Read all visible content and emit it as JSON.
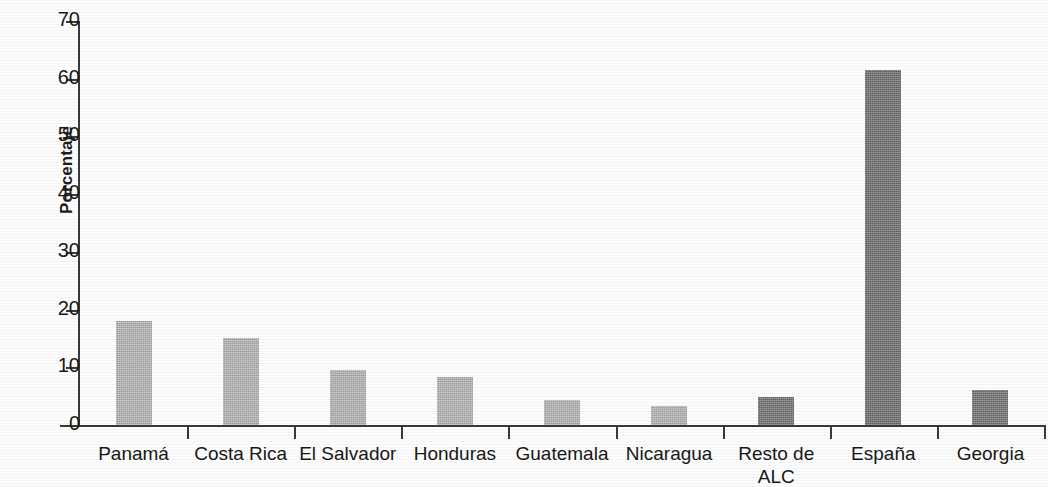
{
  "chart_data": {
    "type": "bar",
    "title": "",
    "subtitle": "",
    "xlabel": "",
    "ylabel": "Porcentaje",
    "ylim": [
      0,
      70
    ],
    "ytick_step": 10,
    "yticks": [
      "70",
      "60",
      "50",
      "40",
      "30",
      "20",
      "10",
      "0"
    ],
    "grid": false,
    "legend": null,
    "categories": [
      "Panamá",
      "Costa Rica",
      "El Salvador",
      "Honduras",
      "Guatemala",
      "Nicaragua",
      "Resto de\nALC",
      "España",
      "Georgia"
    ],
    "values": [
      18.0,
      15.0,
      9.5,
      8.3,
      4.4,
      3.3,
      4.8,
      61.5,
      6.1
    ],
    "bar_colors": [
      "#b4b4b4",
      "#b4b4b4",
      "#b4b4b4",
      "#b4b4b4",
      "#b4b4b4",
      "#b4b4b4",
      "#6f6f6f",
      "#6a6a6a",
      "#6f6f6f"
    ],
    "series": [
      {
        "name": "Porcentaje",
        "values": [
          18.0,
          15.0,
          9.5,
          8.3,
          4.4,
          3.3,
          4.8,
          61.5,
          6.1
        ]
      }
    ]
  },
  "style": {
    "axis_color": "#3a3a3a",
    "text_color": "#171717",
    "background": "#fdfdfd",
    "light_bar": "#b4b4b4",
    "dark_bar": "#6c6c6c"
  }
}
